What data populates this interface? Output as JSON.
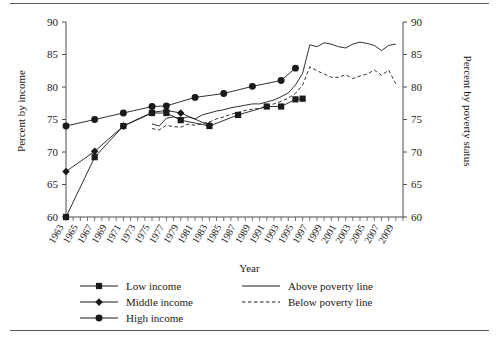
{
  "chart_data": {
    "type": "line",
    "title": "",
    "subtitle": "",
    "xlabel": "Year",
    "ylabel": "Percent by income",
    "ylabel_right": "Percent by poverty status",
    "xlim": [
      1963,
      2010
    ],
    "ylim": [
      60,
      90
    ],
    "yticks": [
      60,
      65,
      70,
      75,
      80,
      85,
      90
    ],
    "yticks_right": [
      60,
      65,
      70,
      75,
      80,
      85,
      90
    ],
    "xticks": [
      1963,
      1965,
      1967,
      1969,
      1971,
      1973,
      1975,
      1977,
      1979,
      1981,
      1983,
      1985,
      1987,
      1989,
      1991,
      1993,
      1995,
      1997,
      1999,
      2001,
      2003,
      2005,
      2007,
      2009
    ],
    "xtick_labels": [
      "1963",
      "1965",
      "1967",
      "1969",
      "1971",
      "1973",
      "1975",
      "1977",
      "1979",
      "1981",
      "1983",
      "1985",
      "1987",
      "1989",
      "1991",
      "1993",
      "1995",
      "1997",
      "1999",
      "2001",
      "2003",
      "2005",
      "2007",
      "2009"
    ],
    "minor_xticks_every": 1,
    "grid": false,
    "legend_position": "below-axes",
    "series": [
      {
        "name": "Low income",
        "marker": "square",
        "linestyle": "solid",
        "axis": "left",
        "x": [
          1963,
          1967,
          1971,
          1975,
          1977,
          1979,
          1983,
          1987,
          1991,
          1993,
          1995,
          1996
        ],
        "y": [
          60.0,
          69.2,
          74.0,
          76.0,
          76.0,
          74.9,
          74.0,
          75.7,
          77.0,
          77.0,
          78.1,
          78.2
        ]
      },
      {
        "name": "Middle income",
        "marker": "diamond",
        "linestyle": "solid",
        "axis": "left",
        "x": [
          1963,
          1967,
          1971,
          1975,
          1977,
          1979,
          1983
        ],
        "y": [
          67.0,
          70.1,
          74.0,
          76.1,
          76.4,
          76.0,
          74.1
        ]
      },
      {
        "name": "High income",
        "marker": "circle",
        "linestyle": "solid",
        "axis": "left",
        "x": [
          1963,
          1967,
          1971,
          1975,
          1977,
          1981,
          1985,
          1989,
          1993,
          1995
        ],
        "y": [
          74.0,
          75.0,
          76.0,
          77.0,
          77.1,
          78.4,
          79.0,
          80.1,
          81.0,
          82.9
        ]
      },
      {
        "name": "Above poverty line",
        "marker": "none",
        "linestyle": "solid",
        "axis": "right",
        "x": [
          1975,
          1976,
          1977,
          1978,
          1979,
          1980,
          1981,
          1982,
          1983,
          1984,
          1985,
          1986,
          1987,
          1988,
          1989,
          1990,
          1991,
          1992,
          1993,
          1994,
          1995,
          1996,
          1997,
          1998,
          1999,
          2000,
          2001,
          2002,
          2003,
          2004,
          2005,
          2006,
          2007,
          2008,
          2009
        ],
        "y": [
          74.3,
          74.0,
          75.2,
          75.4,
          75.1,
          75.4,
          75.1,
          75.7,
          76.0,
          76.3,
          76.5,
          76.8,
          77.0,
          77.2,
          77.4,
          77.4,
          77.7,
          78.0,
          78.5,
          79.1,
          80.3,
          82.1,
          86.5,
          86.2,
          86.8,
          86.6,
          86.2,
          86.0,
          86.6,
          86.9,
          86.7,
          86.4,
          85.6,
          86.4,
          86.6
        ]
      },
      {
        "name": "Below poverty line",
        "marker": "none",
        "linestyle": "dashed",
        "axis": "right",
        "x": [
          1975,
          1976,
          1977,
          1978,
          1979,
          1980,
          1981,
          1982,
          1983,
          1984,
          1985,
          1986,
          1987,
          1988,
          1989,
          1990,
          1991,
          1992,
          1993,
          1994,
          1995,
          1996,
          1997,
          1998,
          1999,
          2000,
          2001,
          2002,
          2003,
          2004,
          2005,
          2006,
          2007,
          2008,
          2009
        ],
        "y": [
          73.6,
          73.4,
          74.1,
          73.9,
          73.8,
          74.3,
          74.1,
          74.4,
          74.6,
          75.1,
          75.4,
          75.8,
          76.1,
          76.4,
          76.6,
          76.7,
          77.1,
          77.4,
          77.8,
          78.3,
          79.0,
          80.3,
          83.1,
          82.5,
          82.0,
          81.5,
          81.5,
          81.9,
          81.3,
          81.7,
          82.0,
          82.6,
          81.8,
          82.6,
          80.5
        ]
      }
    ]
  },
  "axes": {
    "ylabel_left": "Percent by income",
    "ylabel_right": "Percent by poverty status",
    "xlabel": "Year"
  },
  "legend": {
    "left_column": [
      {
        "label": "Low income",
        "marker": "square",
        "linestyle": "solid"
      },
      {
        "label": "Middle income",
        "marker": "diamond",
        "linestyle": "solid"
      },
      {
        "label": "High income",
        "marker": "circle",
        "linestyle": "solid"
      }
    ],
    "right_column": [
      {
        "label": "Above poverty line",
        "marker": "none",
        "linestyle": "solid"
      },
      {
        "label": "Below poverty line",
        "marker": "none",
        "linestyle": "dashed"
      }
    ]
  },
  "colors": {
    "ink": "#1a1a1a",
    "axis": "#4d4d4d",
    "rule": "#5a5a5a",
    "background": "#ffffff"
  }
}
